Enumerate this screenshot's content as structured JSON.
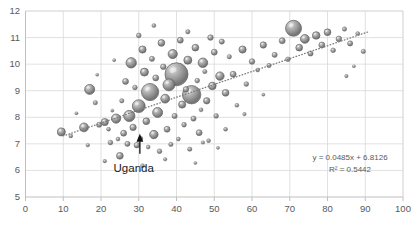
{
  "chart_data": {
    "type": "scatter",
    "title": "",
    "xlabel": "",
    "ylabel": "",
    "xlim": [
      0,
      100
    ],
    "ylim": [
      5,
      12
    ],
    "xticks": [
      0,
      10,
      20,
      30,
      40,
      50,
      60,
      70,
      80,
      90,
      100
    ],
    "yticks": [
      5,
      6,
      7,
      8,
      9,
      10,
      11,
      12
    ],
    "grid": true,
    "legend": "none",
    "bubble_style": "3d-sphere-gray",
    "colors": {
      "bubble_fill": "#8b8b8b",
      "bubble_edge": "#5c5c5c",
      "bubble_highlight": "#e2e2e2",
      "gridline": "#d9d9d9",
      "axis": "#bfbfbf",
      "tick_text": "#58595b",
      "trendline": "#7a7a7a",
      "annotation_text": "#1a1a1a"
    },
    "trendline": {
      "equation": "y = 0.0485x + 6.8126",
      "r_squared": "R² = 0.5442",
      "slope": 0.0485,
      "intercept": 6.8126,
      "style": "dotted",
      "x_start": 10,
      "x_end": 91
    },
    "annotations": [
      {
        "label": "Uganda",
        "marker": "up-arrow",
        "point_x": 25.0,
        "point_y": 6.55,
        "label_x": 26.5,
        "label_y": 6.05
      }
    ],
    "points": [
      {
        "x": 9.5,
        "y": 7.45,
        "r": 4.0
      },
      {
        "x": 12.0,
        "y": 7.3,
        "r": 2.0
      },
      {
        "x": 15.5,
        "y": 7.62,
        "r": 4.4
      },
      {
        "x": 17.0,
        "y": 9.05,
        "r": 5.0
      },
      {
        "x": 18.5,
        "y": 8.55,
        "r": 2.2
      },
      {
        "x": 19.5,
        "y": 7.72,
        "r": 2.6
      },
      {
        "x": 21.0,
        "y": 7.82,
        "r": 3.6
      },
      {
        "x": 22.0,
        "y": 7.55,
        "r": 2.0
      },
      {
        "x": 22.5,
        "y": 7.05,
        "r": 2.4
      },
      {
        "x": 23.0,
        "y": 8.25,
        "r": 1.6
      },
      {
        "x": 24.0,
        "y": 7.95,
        "r": 4.6
      },
      {
        "x": 24.5,
        "y": 7.18,
        "r": 2.0
      },
      {
        "x": 25.0,
        "y": 6.55,
        "r": 3.4
      },
      {
        "x": 25.5,
        "y": 8.62,
        "r": 2.2
      },
      {
        "x": 26.0,
        "y": 7.4,
        "r": 3.0
      },
      {
        "x": 26.5,
        "y": 9.35,
        "r": 3.0
      },
      {
        "x": 27.0,
        "y": 7.0,
        "r": 2.6
      },
      {
        "x": 27.5,
        "y": 8.05,
        "r": 5.6
      },
      {
        "x": 28.0,
        "y": 10.05,
        "r": 5.2
      },
      {
        "x": 28.5,
        "y": 7.62,
        "r": 3.2
      },
      {
        "x": 29.0,
        "y": 9.12,
        "r": 2.4
      },
      {
        "x": 29.5,
        "y": 6.95,
        "r": 2.8
      },
      {
        "x": 30.0,
        "y": 8.42,
        "r": 6.4
      },
      {
        "x": 30.5,
        "y": 7.2,
        "r": 2.2
      },
      {
        "x": 31.0,
        "y": 10.55,
        "r": 3.6
      },
      {
        "x": 31.5,
        "y": 9.7,
        "r": 4.0
      },
      {
        "x": 32.0,
        "y": 7.85,
        "r": 3.4
      },
      {
        "x": 32.5,
        "y": 6.88,
        "r": 2.0
      },
      {
        "x": 33.0,
        "y": 8.95,
        "r": 8.6
      },
      {
        "x": 33.5,
        "y": 10.2,
        "r": 2.6
      },
      {
        "x": 34.0,
        "y": 7.35,
        "r": 4.2
      },
      {
        "x": 34.5,
        "y": 9.48,
        "r": 3.0
      },
      {
        "x": 35.0,
        "y": 8.18,
        "r": 5.0
      },
      {
        "x": 35.5,
        "y": 6.72,
        "r": 2.4
      },
      {
        "x": 36.0,
        "y": 10.8,
        "r": 3.4
      },
      {
        "x": 36.5,
        "y": 9.9,
        "r": 2.8
      },
      {
        "x": 37.0,
        "y": 8.7,
        "r": 4.4
      },
      {
        "x": 37.5,
        "y": 7.55,
        "r": 3.0
      },
      {
        "x": 38.0,
        "y": 9.22,
        "r": 6.0
      },
      {
        "x": 38.5,
        "y": 6.98,
        "r": 2.2
      },
      {
        "x": 39.0,
        "y": 10.38,
        "r": 4.6
      },
      {
        "x": 39.5,
        "y": 8.05,
        "r": 2.6
      },
      {
        "x": 40.0,
        "y": 9.62,
        "r": 11.5
      },
      {
        "x": 40.5,
        "y": 7.18,
        "r": 2.0
      },
      {
        "x": 41.0,
        "y": 10.9,
        "r": 3.0
      },
      {
        "x": 41.5,
        "y": 8.48,
        "r": 3.6
      },
      {
        "x": 42.0,
        "y": 7.72,
        "r": 2.4
      },
      {
        "x": 42.5,
        "y": 9.05,
        "r": 2.8
      },
      {
        "x": 43.0,
        "y": 10.15,
        "r": 4.0
      },
      {
        "x": 43.5,
        "y": 6.8,
        "r": 2.2
      },
      {
        "x": 44.0,
        "y": 8.85,
        "r": 9.2
      },
      {
        "x": 44.5,
        "y": 7.95,
        "r": 2.6
      },
      {
        "x": 45.0,
        "y": 10.62,
        "r": 3.4
      },
      {
        "x": 45.5,
        "y": 9.38,
        "r": 2.4
      },
      {
        "x": 46.0,
        "y": 7.42,
        "r": 3.0
      },
      {
        "x": 46.5,
        "y": 8.28,
        "r": 2.0
      },
      {
        "x": 47.0,
        "y": 10.05,
        "r": 4.8
      },
      {
        "x": 47.5,
        "y": 9.72,
        "r": 2.2
      },
      {
        "x": 48.0,
        "y": 8.62,
        "r": 3.2
      },
      {
        "x": 48.5,
        "y": 7.12,
        "r": 2.0
      },
      {
        "x": 49.0,
        "y": 11.0,
        "r": 2.8
      },
      {
        "x": 49.5,
        "y": 9.18,
        "r": 3.8
      },
      {
        "x": 50.0,
        "y": 10.45,
        "r": 3.0
      },
      {
        "x": 50.5,
        "y": 8.05,
        "r": 2.4
      },
      {
        "x": 51.5,
        "y": 9.55,
        "r": 4.2
      },
      {
        "x": 52.0,
        "y": 10.85,
        "r": 2.6
      },
      {
        "x": 53.0,
        "y": 8.92,
        "r": 3.4
      },
      {
        "x": 54.0,
        "y": 10.28,
        "r": 2.2
      },
      {
        "x": 55.0,
        "y": 9.62,
        "r": 3.0
      },
      {
        "x": 56.0,
        "y": 8.45,
        "r": 2.0
      },
      {
        "x": 57.5,
        "y": 10.55,
        "r": 3.6
      },
      {
        "x": 58.5,
        "y": 9.25,
        "r": 2.4
      },
      {
        "x": 60.0,
        "y": 10.1,
        "r": 2.8
      },
      {
        "x": 61.5,
        "y": 9.78,
        "r": 2.0
      },
      {
        "x": 63.0,
        "y": 10.72,
        "r": 3.2
      },
      {
        "x": 64.5,
        "y": 9.95,
        "r": 2.2
      },
      {
        "x": 66.0,
        "y": 10.35,
        "r": 2.6
      },
      {
        "x": 68.0,
        "y": 10.88,
        "r": 3.0
      },
      {
        "x": 69.5,
        "y": 10.18,
        "r": 2.4
      },
      {
        "x": 71.0,
        "y": 11.35,
        "r": 8.0
      },
      {
        "x": 72.5,
        "y": 10.62,
        "r": 3.4
      },
      {
        "x": 74.0,
        "y": 10.95,
        "r": 4.4
      },
      {
        "x": 75.5,
        "y": 10.4,
        "r": 2.6
      },
      {
        "x": 77.0,
        "y": 11.08,
        "r": 3.8
      },
      {
        "x": 78.5,
        "y": 10.72,
        "r": 3.0
      },
      {
        "x": 80.0,
        "y": 11.2,
        "r": 3.4
      },
      {
        "x": 81.5,
        "y": 10.52,
        "r": 2.4
      },
      {
        "x": 83.0,
        "y": 10.95,
        "r": 2.8
      },
      {
        "x": 84.5,
        "y": 11.32,
        "r": 2.2
      },
      {
        "x": 86.0,
        "y": 10.78,
        "r": 2.6
      },
      {
        "x": 88.0,
        "y": 11.15,
        "r": 2.0
      },
      {
        "x": 89.5,
        "y": 10.48,
        "r": 2.2
      },
      {
        "x": 30.0,
        "y": 11.08,
        "r": 2.4
      },
      {
        "x": 34.0,
        "y": 11.45,
        "r": 2.0
      },
      {
        "x": 43.0,
        "y": 11.22,
        "r": 2.2
      },
      {
        "x": 21.0,
        "y": 6.35,
        "r": 1.8
      },
      {
        "x": 31.0,
        "y": 6.18,
        "r": 2.0
      },
      {
        "x": 37.0,
        "y": 6.42,
        "r": 1.8
      },
      {
        "x": 45.0,
        "y": 6.28,
        "r": 1.6
      },
      {
        "x": 53.0,
        "y": 7.55,
        "r": 2.0
      },
      {
        "x": 58.0,
        "y": 8.12,
        "r": 1.8
      },
      {
        "x": 63.0,
        "y": 8.85,
        "r": 1.6
      },
      {
        "x": 85.0,
        "y": 9.55,
        "r": 1.8
      },
      {
        "x": 87.0,
        "y": 9.92,
        "r": 1.6
      },
      {
        "x": 13.5,
        "y": 8.15,
        "r": 1.6
      },
      {
        "x": 16.5,
        "y": 6.95,
        "r": 1.8
      },
      {
        "x": 19.0,
        "y": 9.6,
        "r": 1.6
      },
      {
        "x": 23.5,
        "y": 10.15,
        "r": 1.6
      },
      {
        "x": 47.0,
        "y": 7.05,
        "r": 1.8
      },
      {
        "x": 51.0,
        "y": 6.85,
        "r": 1.6
      }
    ]
  }
}
